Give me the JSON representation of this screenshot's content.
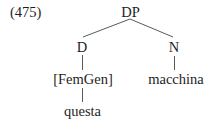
{
  "example": {
    "number": "(475)"
  },
  "tree": {
    "root": {
      "label": "DP",
      "children": [
        {
          "label": "D",
          "children": [
            {
              "label": "[FemGen]",
              "children": [
                {
                  "label": "questa"
                }
              ]
            }
          ]
        },
        {
          "label": "N",
          "children": [
            {
              "label": "macchina"
            }
          ]
        }
      ]
    }
  },
  "colors": {
    "text": "#1e1e1e",
    "edges": "#5a5a5a",
    "background": "#ffffff"
  }
}
